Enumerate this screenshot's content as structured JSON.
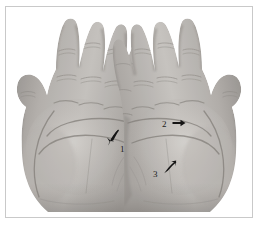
{
  "figure": {
    "alt": "Grayscale photograph showing the palmar surface of a left and a right hand, fingers extended, with three black arrow markers labelled 1, 2 and 3 pointing to palm crease landmarks",
    "color_mode": "grayscale",
    "background_color": "#ffffff",
    "frame_color": "#c9c9c9",
    "skin_tone_light": "#c9c6c2",
    "skin_tone_mid": "#a9a5a1",
    "skin_tone_dark": "#6f6b68",
    "crease_color": "#8a8682",
    "marker_color": "#1b1b1b"
  },
  "annotations": [
    {
      "id": "marker-1",
      "label": "1",
      "arrow_direction": "down-left",
      "hand": "left hand (image left)",
      "region": "distal palm below the index and middle finger base"
    },
    {
      "id": "marker-2",
      "label": "2",
      "arrow_direction": "right",
      "hand": "right hand (image right)",
      "region": "upper palm beneath the middle finger base"
    },
    {
      "id": "marker-3",
      "label": "3",
      "arrow_direction": "up-right",
      "hand": "right hand (image right)",
      "region": "mid palm along the proximal transverse crease"
    }
  ],
  "caption": {
    "text": "",
    "note": "caption line cropped at the bottom edge of the image"
  }
}
